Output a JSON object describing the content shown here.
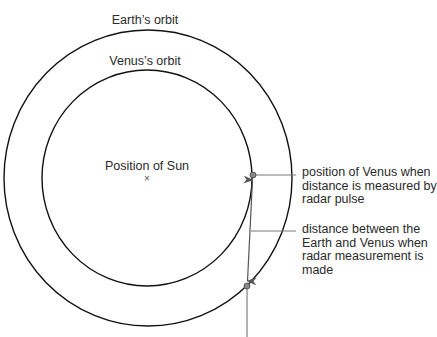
{
  "diagram": {
    "labels": {
      "earth_orbit": "Earth’s orbit",
      "venus_orbit": "Venus’s orbit",
      "sun": "Position of Sun",
      "sun_marker": "×",
      "venus_position": [
        "position of Venus when",
        "distance is measured by",
        "radar pulse"
      ],
      "distance": [
        "distance between the",
        "Earth and Venus when",
        "radar measurement is",
        "made"
      ]
    },
    "colors": {
      "orbit": "#111111",
      "leader": "#666666",
      "point": "#777777",
      "text": "#2a2a2a"
    }
  }
}
